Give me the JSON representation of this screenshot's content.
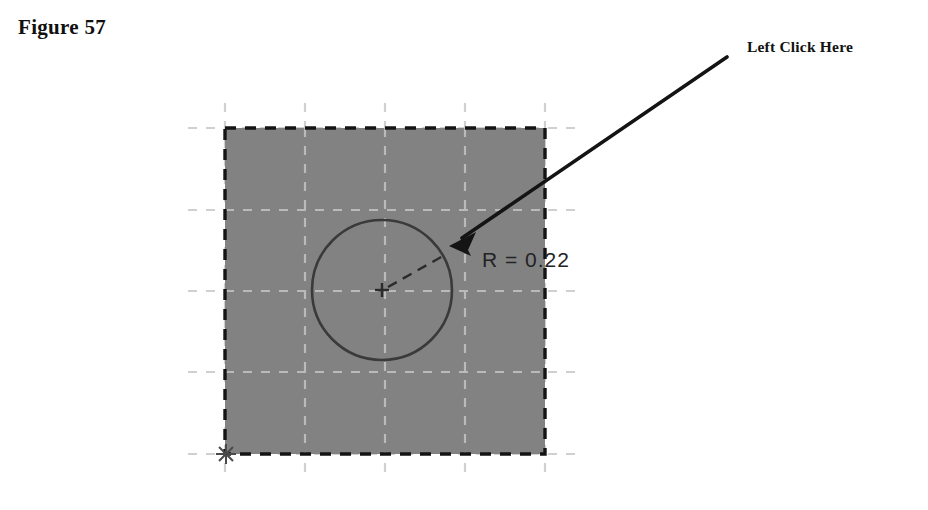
{
  "figure": {
    "caption": "Figure 57"
  },
  "callout": {
    "label": "Left Click Here",
    "arrow_icon": "arrow-pointer-icon",
    "arrow_start": {
      "x": 727,
      "y": 57
    },
    "arrow_tip": {
      "x": 450,
      "y": 245
    }
  },
  "sketch": {
    "shaded_region": {
      "name": "shaded-square-region",
      "fill_color": "#828282",
      "border_color": "#1a1a1a",
      "border_style": "dashed",
      "x": 225,
      "y": 128,
      "width": 320,
      "height": 326
    },
    "grid": {
      "line_color": "#d8d8d8",
      "line_style": "dashed",
      "spacing_px": 81,
      "vertical_x": [
        225,
        305,
        385,
        465,
        545
      ],
      "horizontal_y": [
        128,
        210,
        291,
        372,
        454
      ]
    },
    "origin_marker": {
      "name": "origin-marker-icon",
      "x": 226,
      "y": 454,
      "color": "#555555"
    },
    "circle": {
      "name": "circle-entity",
      "center_x": 382,
      "center_y": 290,
      "radius": 70,
      "stroke_color": "#3a3a3a"
    },
    "center_mark": {
      "name": "center-mark-icon",
      "x": 382,
      "y": 290,
      "size": 12,
      "color": "#2b2b2b"
    },
    "radius_dimension": {
      "label": "R = 0.22",
      "value": "0.22",
      "leader_from": {
        "x": 388,
        "y": 287
      },
      "leader_to": {
        "x": 440,
        "y": 258
      },
      "text_x": 482,
      "text_y": 248,
      "color": "#232323"
    }
  }
}
